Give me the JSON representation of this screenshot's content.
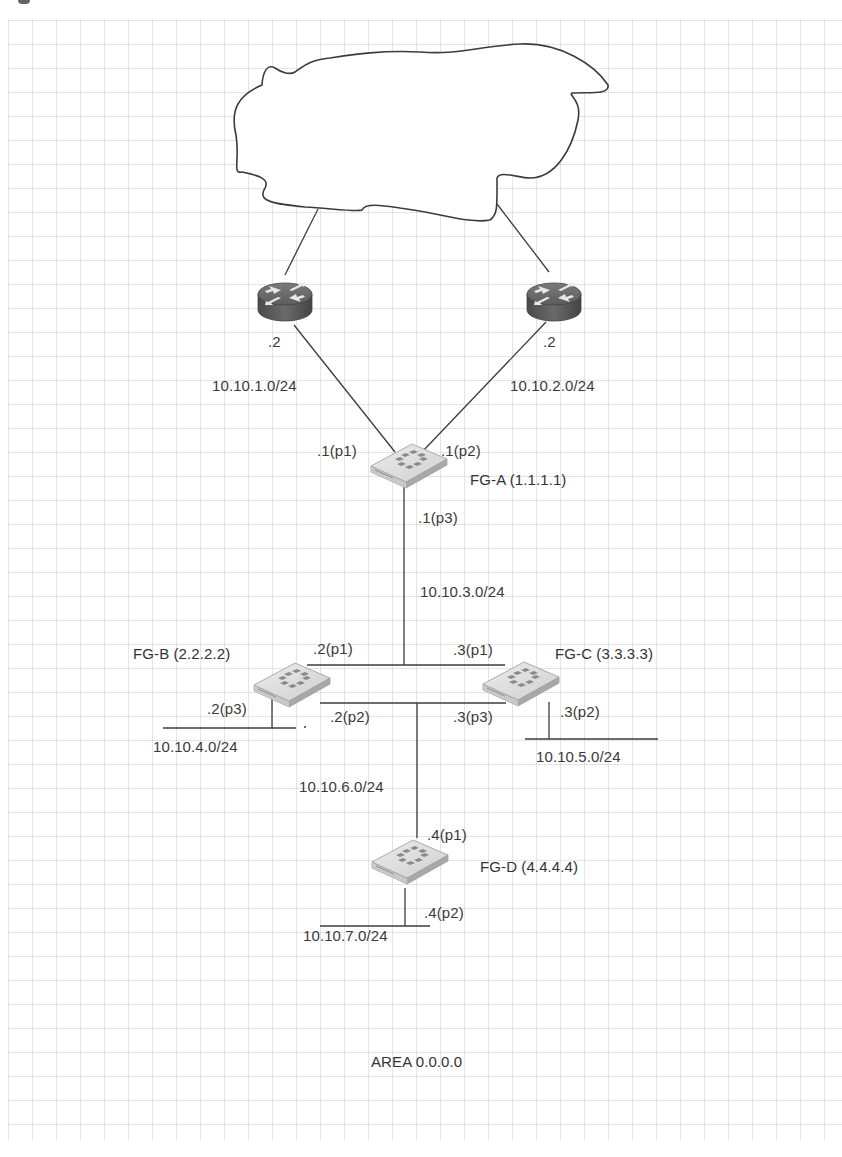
{
  "diagram": {
    "type": "network-topology",
    "area_label": "AREA 0.0.0.0",
    "cloud": {
      "label": ""
    },
    "routers": [
      {
        "id": "router-left",
        "ip_suffix": ".2"
      },
      {
        "id": "router-right",
        "ip_suffix": ".2"
      }
    ],
    "firewalls": [
      {
        "id": "fg-a",
        "name": "FG-A (1.1.1.1)",
        "ports": {
          "p1": ".1(p1)",
          "p2": ".1(p2)",
          "p3": ".1(p3)"
        }
      },
      {
        "id": "fg-b",
        "name": "FG-B (2.2.2.2)",
        "ports": {
          "p1": ".2(p1)",
          "p2": ".2(p2)",
          "p3": ".2(p3)"
        }
      },
      {
        "id": "fg-c",
        "name": "FG-C (3.3.3.3)",
        "ports": {
          "p1": ".3(p1)",
          "p2": ".3(p2)",
          "p3": ".3(p3)"
        }
      },
      {
        "id": "fg-d",
        "name": "FG-D (4.4.4.4)",
        "ports": {
          "p1": ".4(p1)",
          "p2": ".4(p2)"
        }
      }
    ],
    "subnets": {
      "s1": "10.10.1.0/24",
      "s2": "10.10.2.0/24",
      "s3": "10.10.3.0/24",
      "s4": "10.10.4.0/24",
      "s5": "10.10.5.0/24",
      "s6": "10.10.6.0/24",
      "s7": "10.10.7.0/24"
    },
    "colors": {
      "line": "#3c3c3c",
      "router_body": "#5a5a5a",
      "router_top": "#6e6e6e",
      "firewall_body": "#d6d6d6",
      "firewall_logo": "#8a8a8a",
      "grid": "#c8c8c8",
      "text": "#3a3a3a"
    }
  }
}
